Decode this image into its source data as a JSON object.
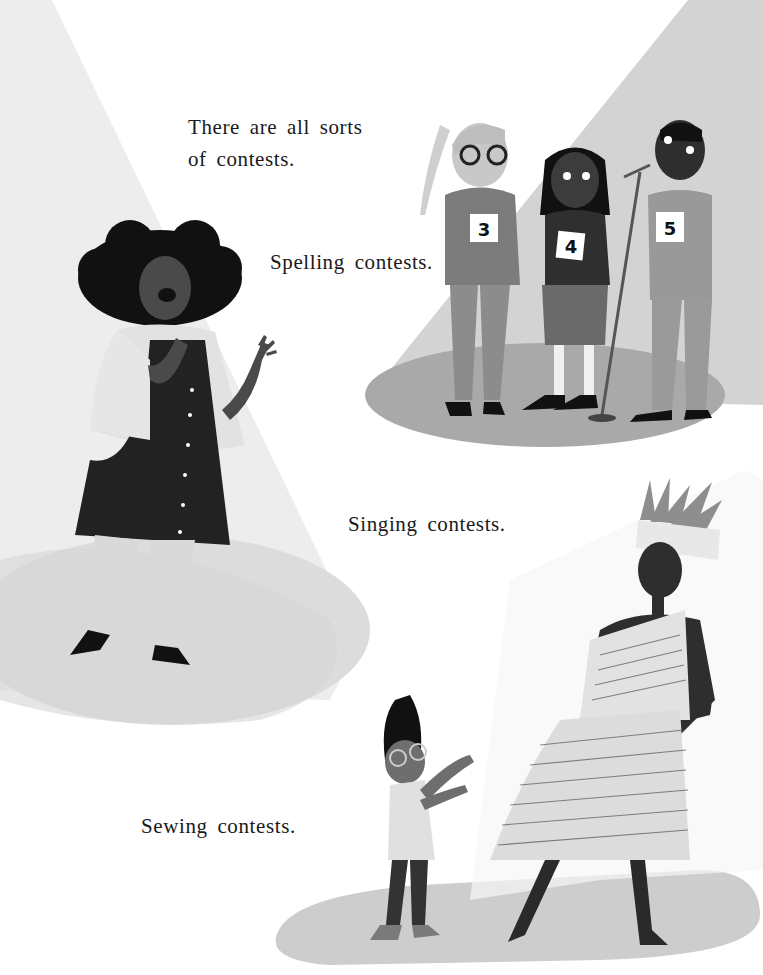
{
  "page": {
    "texts": {
      "intro_line1": "There are all sorts",
      "intro_line2": "of contests.",
      "spelling": "Spelling contests.",
      "singing": "Singing contests.",
      "sewing": "Sewing contests."
    },
    "scenes": [
      {
        "name": "singing-scene",
        "description": "Singer with curly hair holding microphone in left spotlight"
      },
      {
        "name": "spelling-scene",
        "description": "Three contestants wearing numbered cards at microphone stand in right spotlight"
      },
      {
        "name": "sewing-scene",
        "description": "Child with glasses pointing at woman in newspaper dress"
      }
    ],
    "contestant_numbers": [
      "3",
      "4",
      "5"
    ],
    "colors": {
      "spotlight": "#ececec",
      "stage_floor": "#cfcfcf",
      "stage_floor_dark": "#b3b3b3",
      "skin_dark": "#3e3e3e",
      "clothing_dark": "#242424",
      "text": "#1a1a1a"
    }
  }
}
